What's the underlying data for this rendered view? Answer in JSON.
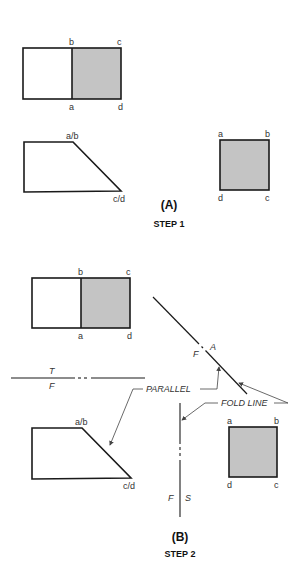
{
  "step1": {
    "caption": "(A)",
    "step_label": "STEP 1",
    "top_view": {
      "labels": {
        "b": "b",
        "c": "c",
        "a": "a",
        "d": "d"
      }
    },
    "front_view": {
      "labels": {
        "ab": "a/b",
        "cd": "c/d"
      }
    },
    "side_view": {
      "labels": {
        "a": "a",
        "b": "b",
        "d": "d",
        "c": "c"
      }
    }
  },
  "step2": {
    "caption": "(B)",
    "step_label": "STEP 2",
    "top_view": {
      "labels": {
        "b": "b",
        "c": "c",
        "a": "a",
        "d": "d"
      }
    },
    "front_view": {
      "labels": {
        "ab": "a/b",
        "cd": "c/d"
      }
    },
    "aux_view": {
      "labels": {
        "a": "a",
        "b": "b",
        "d": "d",
        "c": "c"
      }
    },
    "fold_lines": {
      "tf": {
        "top": "T",
        "bottom": "F"
      },
      "fa": {
        "left": "F",
        "right": "A"
      },
      "fs": {
        "left": "F",
        "right": "S"
      }
    },
    "annotations": {
      "parallel": "PARALLEL",
      "fold_line": "FOLD LINE"
    }
  },
  "colors": {
    "shade": "#c4c4c4",
    "line": "#1a1a1a"
  }
}
